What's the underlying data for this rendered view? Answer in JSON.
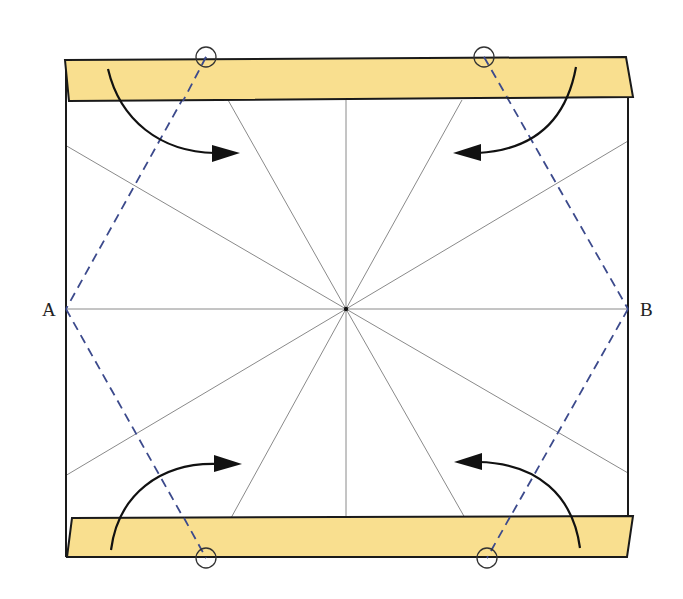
{
  "diagram": {
    "type": "origami-fold-step",
    "labels": {
      "point_a": "A",
      "point_b": "B"
    },
    "colors": {
      "paper": "#ffffff",
      "strip_fill": "#f9df8f",
      "outline": "#1a1a1a",
      "crease": "#8a8a8a",
      "valley_fold": "#3c4a8c",
      "arrow": "#111111",
      "circle_marker": "#333333"
    },
    "geometry": {
      "center": [
        346,
        309
      ],
      "square": {
        "left": 65,
        "right": 628,
        "top": 60,
        "bottom": 557
      },
      "point_a": [
        65,
        309
      ],
      "point_b": [
        628,
        309
      ],
      "top_strip": [
        [
          65,
          60
        ],
        [
          626,
          57
        ],
        [
          633,
          97
        ],
        [
          69,
          101
        ]
      ],
      "bottom_strip": [
        [
          72,
          518
        ],
        [
          633,
          516
        ],
        [
          627,
          557
        ],
        [
          67,
          557
        ]
      ],
      "circles": [
        [
          206,
          57
        ],
        [
          484,
          57
        ],
        [
          206,
          558
        ],
        [
          487,
          558
        ]
      ],
      "creases": [
        [
          [
            346,
            309
          ],
          [
            346,
            100
          ]
        ],
        [
          [
            346,
            309
          ],
          [
            228,
            100
          ]
        ],
        [
          [
            346,
            309
          ],
          [
            462,
            100
          ]
        ],
        [
          [
            346,
            309
          ],
          [
            65,
            145
          ]
        ],
        [
          [
            346,
            309
          ],
          [
            628,
            141
          ]
        ],
        [
          [
            346,
            309
          ],
          [
            65,
            309
          ]
        ],
        [
          [
            346,
            309
          ],
          [
            628,
            309
          ]
        ],
        [
          [
            346,
            309
          ],
          [
            65,
            476
          ]
        ],
        [
          [
            346,
            309
          ],
          [
            628,
            473
          ]
        ],
        [
          [
            346,
            309
          ],
          [
            346,
            518
          ]
        ],
        [
          [
            346,
            309
          ],
          [
            231,
            518
          ]
        ],
        [
          [
            346,
            309
          ],
          [
            465,
            518
          ]
        ]
      ]
    },
    "arrows": [
      {
        "name": "top-left-fold-arrow",
        "direction": "down-right"
      },
      {
        "name": "top-right-fold-arrow",
        "direction": "down-left"
      },
      {
        "name": "bottom-left-fold-arrow",
        "direction": "up-right"
      },
      {
        "name": "bottom-right-fold-arrow",
        "direction": "up-left"
      }
    ]
  }
}
